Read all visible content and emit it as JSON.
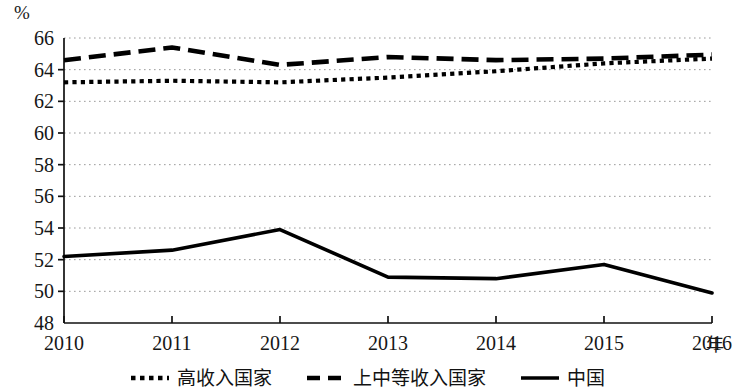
{
  "chart_data": {
    "type": "line",
    "title": "",
    "xlabel": "年",
    "ylabel": "%",
    "x": [
      2010,
      2011,
      2012,
      2013,
      2014,
      2015,
      2016
    ],
    "categories": [
      "2010",
      "2011",
      "2012",
      "2013",
      "2014",
      "2015",
      "2016"
    ],
    "ylim": [
      48,
      66
    ],
    "yticks": [
      48,
      50,
      52,
      54,
      56,
      58,
      60,
      62,
      64,
      66
    ],
    "ytick_labels": [
      "48",
      "50",
      "52",
      "54",
      "56",
      "58",
      "60",
      "62",
      "64",
      "66"
    ],
    "grid": true,
    "grid_style": "dotted-horizontal",
    "legend_position": "bottom-center",
    "series": [
      {
        "name": "高收入国家",
        "style": "dotted",
        "color": "#000000",
        "values": [
          63.2,
          63.3,
          63.2,
          63.5,
          63.9,
          64.4,
          64.7
        ]
      },
      {
        "name": "上中等收入国家",
        "style": "dashed",
        "color": "#000000",
        "values": [
          64.6,
          65.4,
          64.3,
          64.8,
          64.6,
          64.7,
          64.95
        ]
      },
      {
        "name": "中国",
        "style": "solid",
        "color": "#000000",
        "values": [
          52.2,
          52.6,
          53.9,
          50.9,
          50.8,
          51.7,
          49.9
        ]
      }
    ]
  },
  "axes": {
    "y_unit_label": "%",
    "x_unit_label": "年"
  },
  "legend": {
    "items": [
      {
        "label": "高收入国家",
        "style": "dotted"
      },
      {
        "label": "上中等收入国家",
        "style": "dashed"
      },
      {
        "label": "中国",
        "style": "solid"
      }
    ]
  }
}
